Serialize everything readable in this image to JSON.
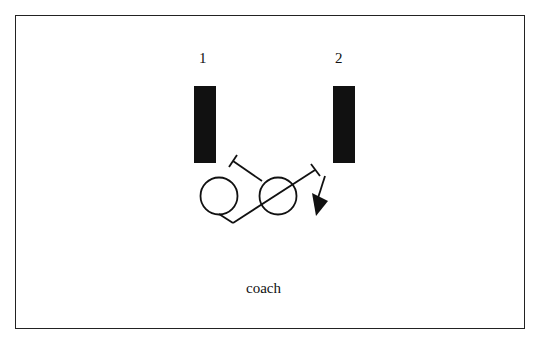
{
  "diagram": {
    "labels": {
      "post_1": "1",
      "post_2": "2",
      "coach": "coach"
    },
    "elements": [
      {
        "type": "post",
        "id": "post-1",
        "label": "1"
      },
      {
        "type": "post",
        "id": "post-2",
        "label": "2"
      },
      {
        "type": "player",
        "id": "player-left"
      },
      {
        "type": "player",
        "id": "player-right"
      },
      {
        "type": "movement-path",
        "id": "path-to-post-1"
      },
      {
        "type": "movement-path",
        "id": "path-to-post-2"
      },
      {
        "type": "arrow",
        "id": "ball-direction-arrow"
      }
    ],
    "colors": {
      "stroke": "#111111",
      "fill": "#111111",
      "background": "#ffffff"
    }
  }
}
